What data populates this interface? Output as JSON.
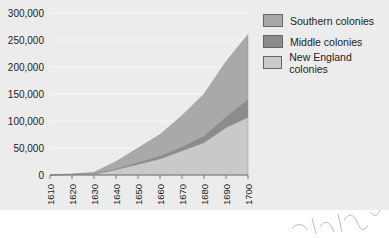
{
  "chart_data": {
    "type": "area",
    "stacked": true,
    "title": "",
    "xlabel": "",
    "ylabel": "",
    "x": [
      1610,
      1620,
      1630,
      1640,
      1650,
      1660,
      1670,
      1680,
      1690,
      1700
    ],
    "ylim": [
      0,
      300000
    ],
    "yticks": [
      "300,000",
      "250,000",
      "200,000",
      "150,000",
      "100,000",
      "50,000",
      "0"
    ],
    "xticks": [
      "1610",
      "1620",
      "1630",
      "1640",
      "1650",
      "1660",
      "1670",
      "1680",
      "1690",
      "1700"
    ],
    "series": [
      {
        "name": "New England colonies",
        "color": "#c9c9c9",
        "values": [
          0,
          1000,
          2000,
          10000,
          20000,
          30000,
          45000,
          60000,
          88000,
          107000
        ]
      },
      {
        "name": "Middle colonies",
        "color": "#8c8c8c",
        "values": [
          0,
          0,
          300,
          1500,
          3000,
          5000,
          7000,
          12000,
          20000,
          33000
        ]
      },
      {
        "name": "Southern colonies",
        "color": "#a9a9a9",
        "values": [
          0,
          1000,
          2700,
          13500,
          27000,
          40000,
          58000,
          78000,
          102000,
          120000
        ]
      }
    ],
    "legend": {
      "position": "top-right",
      "entries": [
        "Southern colonies",
        "Middle colonies",
        "New England colonies"
      ]
    },
    "grid": true
  },
  "legend": {
    "items": [
      {
        "label": "Southern colonies",
        "color": "#a9a9a9"
      },
      {
        "label": "Middle colonies",
        "color": "#8c8c8c"
      },
      {
        "label": "New England colonies",
        "color": "#c9c9c9"
      }
    ]
  }
}
